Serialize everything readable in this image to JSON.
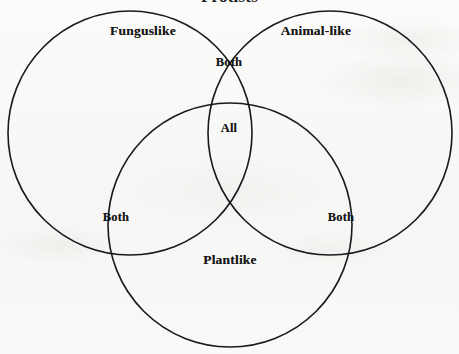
{
  "diagram": {
    "title": "Protists",
    "type": "venn-3-set",
    "background_color": "#f8f8f6",
    "stroke_color": "#1a1a1a",
    "text_color": "#161616",
    "sets": [
      {
        "id": "funguslike",
        "label": "Funguslike",
        "center_x": 130,
        "center_y": 133,
        "radius": 122,
        "label_x": 143,
        "label_y": 31
      },
      {
        "id": "animal-like",
        "label": "Animal-like",
        "center_x": 330,
        "center_y": 133,
        "radius": 122,
        "label_x": 316,
        "label_y": 31
      },
      {
        "id": "plantlike",
        "label": "Plantlike",
        "center_x": 230,
        "center_y": 225,
        "radius": 122,
        "label_x": 230,
        "label_y": 260
      }
    ],
    "regions": [
      {
        "id": "funguslike-animal-overlap",
        "label": "Both",
        "label_x": 229,
        "label_y": 62
      },
      {
        "id": "all-three-overlap",
        "label": "All",
        "label_x": 229,
        "label_y": 128
      },
      {
        "id": "funguslike-plantlike-overlap",
        "label": "Both",
        "label_x": 116,
        "label_y": 217
      },
      {
        "id": "animal-plantlike-overlap",
        "label": "Both",
        "label_x": 341,
        "label_y": 217
      }
    ]
  }
}
